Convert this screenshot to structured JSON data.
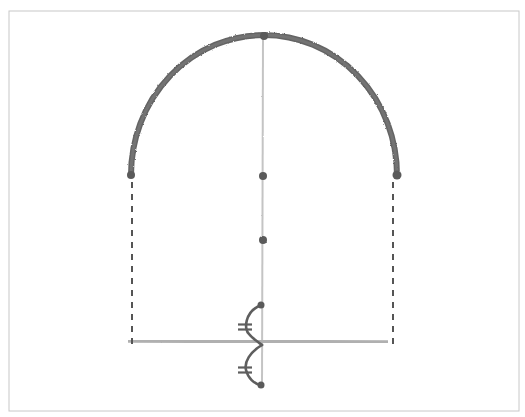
{
  "diagram": {
    "title": "",
    "colors": {
      "background": "#ffffff",
      "frame": "#c8c8c8",
      "arc": "#4a4a4a",
      "guide_line": "#b8b8b8",
      "axis_line": "#c4c4c4",
      "dashed_line": "#555555",
      "points": "#5a5a5a",
      "connector": "#5e5e5e"
    },
    "frame": {
      "x": 9,
      "y": 11,
      "width": 510,
      "height": 400
    },
    "arc": {
      "left": [
        131,
        175
      ],
      "apex": [
        263,
        35
      ],
      "right": [
        397,
        175
      ]
    },
    "diameter_line": {
      "from": [
        131,
        175
      ],
      "to": [
        397,
        175
      ]
    },
    "center_axis": {
      "from": [
        263,
        35
      ],
      "to": [
        262,
        385
      ]
    },
    "baseline": {
      "from": [
        128,
        341
      ],
      "to": [
        388,
        342
      ]
    },
    "dashed_lines": [
      {
        "from": [
          132,
          182
        ],
        "to": [
          132,
          348
        ]
      },
      {
        "from": [
          393,
          182
        ],
        "to": [
          393,
          348
        ]
      }
    ],
    "points": [
      {
        "name": "arc-left-endpoint",
        "cx": 131,
        "cy": 175,
        "r": 4
      },
      {
        "name": "arc-apex",
        "cx": 264,
        "cy": 36,
        "r": 4
      },
      {
        "name": "arc-right-endpoint",
        "cx": 397,
        "cy": 175,
        "r": 4.5
      },
      {
        "name": "center-point",
        "cx": 263,
        "cy": 176,
        "r": 4
      },
      {
        "name": "midpoint",
        "cx": 263,
        "cy": 240,
        "r": 4
      },
      {
        "name": "connector-top-point",
        "cx": 261,
        "cy": 305,
        "r": 3.5
      },
      {
        "name": "connector-bottom-point",
        "cx": 261,
        "cy": 385,
        "r": 3.5
      }
    ],
    "connector": {
      "upper_curve": "M261,305 C244,312 244,330 249,334 C252,338 258,342 262,345",
      "lower_curve": "M262,345 C250,352 244,362 246,370 C248,378 254,384 261,385",
      "tick_marks": [
        {
          "cx": 245,
          "cy": 327
        },
        {
          "cx": 245,
          "cy": 370
        }
      ]
    }
  }
}
